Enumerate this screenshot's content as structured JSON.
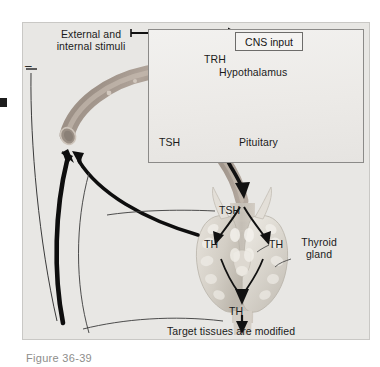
{
  "figure": {
    "caption": "Figure   36-39",
    "background_color": "#e8e7e4",
    "border_color": "#c9c8c5"
  },
  "diagram": {
    "title_concept": "Thyroid hormone regulation feedback loop",
    "type": "physiology-flow-diagram",
    "labels": {
      "stimuli_line1": "External and",
      "stimuli_line2": "internal stimuli",
      "cns_input": "CNS input",
      "trh": "TRH",
      "hypothalamus": "Hypothalamus",
      "tsh_pituitary": "TSH",
      "pituitary": "Pituitary",
      "tsh_blood": "TSH",
      "th_left": "TH",
      "th_right": "TH",
      "thyroid_line1": "Thyroid",
      "thyroid_line2": "gland",
      "th_bottom": "TH",
      "target": "Target tissues are modified",
      "negative_feedback_symbol": "–"
    },
    "colors": {
      "arrow_black": "#111111",
      "vessel_tan": "#a79a8f",
      "vessel_light": "#c9bfb4",
      "gland_pale": "#d8d4cd",
      "thin_line": "#3b3b3b",
      "box_border": "#6d6c6a"
    },
    "flow_steps": [
      "External and internal stimuli",
      "CNS input",
      "Hypothalamus releases TRH",
      "Pituitary releases TSH",
      "Thyroid gland releases TH",
      "Target tissues are modified",
      "Negative feedback to hypothalamus and pituitary"
    ]
  }
}
